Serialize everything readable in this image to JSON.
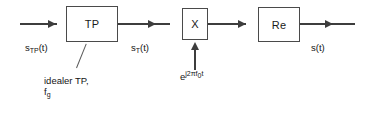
{
  "diagram": {
    "blocks": [
      {
        "id": "lowpass",
        "label": "TP",
        "name": "lowpass-filter-block"
      },
      {
        "id": "multiplier",
        "label": "X",
        "name": "multiplier-block"
      },
      {
        "id": "real-part",
        "label": "Re",
        "name": "real-part-block"
      }
    ],
    "signals": {
      "input": {
        "base": "s",
        "subscript": "TP",
        "suffix": "(t)"
      },
      "filtered": {
        "base": "s",
        "subscript": "T",
        "suffix": "(t)"
      },
      "output": {
        "base": "s",
        "subscript": "",
        "suffix": "(t)"
      },
      "carrier": {
        "base": "e",
        "exponent": "j2πf",
        "exp_subscript": "0",
        "exp_suffix": "t"
      }
    },
    "annotation": {
      "line1": "idealer TP,",
      "line2_base": "f",
      "line2_subscript": "g"
    },
    "colors": {
      "stroke": "#4a4a4a",
      "wire": "#3d3d3d",
      "text": "#141414",
      "background": "#ffffff"
    }
  }
}
